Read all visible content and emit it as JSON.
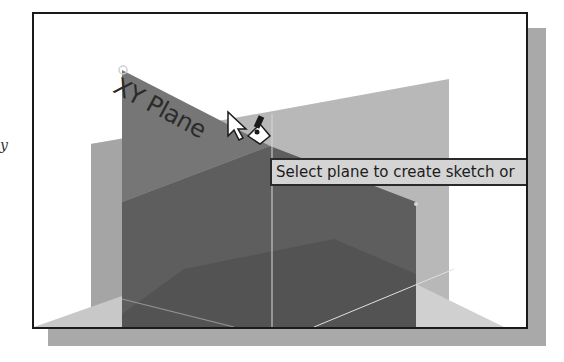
{
  "stray_glyph": "y",
  "viewport": {
    "plane_label": "XY Plane",
    "tooltip_text": "Select plane to create sketch or",
    "cursor": "select-plane-cursor"
  },
  "colors": {
    "frame_border": "#1a1a1a",
    "shadow": "#a9a9a9",
    "xy_plane": "#6e6e6e",
    "back_plane": "#b5b5b5",
    "lower_plane": "#5a5a5a",
    "tooltip_bg": "#d4d4d4"
  }
}
